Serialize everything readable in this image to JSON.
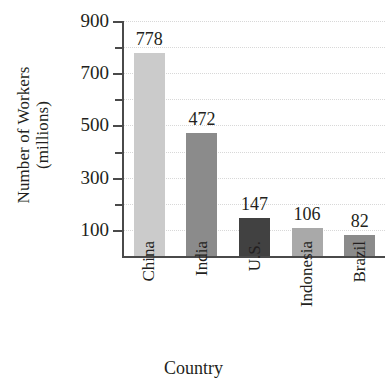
{
  "chart_data": {
    "type": "bar",
    "title": "",
    "xlabel": "Country",
    "ylabel_line1": "Number of Workers",
    "ylabel_line2": "(millions)",
    "categories": [
      "China",
      "India",
      "U.S.",
      "Indonesia",
      "Brazil"
    ],
    "values": [
      778,
      472,
      147,
      106,
      82
    ],
    "value_labels": [
      "778",
      "472",
      "147",
      "106",
      "82"
    ],
    "bar_colors": [
      "#cbcbcb",
      "#8b8b8b",
      "#414141",
      "#a9a9a9",
      "#8b8b8b"
    ],
    "ylim": [
      0,
      900
    ],
    "ytick_labels": [
      "900",
      "700",
      "500",
      "300",
      "100"
    ],
    "ytick_values": [
      900,
      700,
      500,
      300,
      100
    ],
    "yminor_values": [
      800,
      600,
      400,
      200
    ],
    "grid": true,
    "grid_style": "dotted",
    "grid_color": "#d8d8d8",
    "axis_color": "#4a4a4a",
    "legend": "none",
    "xtick_rotation": 90
  }
}
